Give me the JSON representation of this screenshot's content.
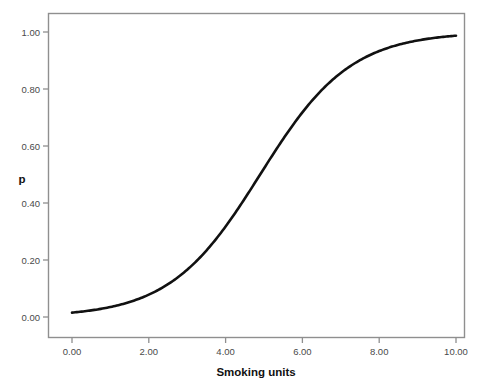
{
  "chart_data": {
    "type": "line",
    "title": "",
    "subtitle": "",
    "xlabel": "Smoking units",
    "ylabel": "p",
    "xlim": [
      0,
      10
    ],
    "ylim": [
      0.0,
      1.0
    ],
    "grid": false,
    "legend": null,
    "x_tick_labels": [
      "0.00",
      "2.00",
      "4.00",
      "6.00",
      "8.00",
      "10.00"
    ],
    "x_tick_values": [
      0,
      2,
      4,
      6,
      8,
      10
    ],
    "y_tick_labels": [
      "0.00",
      "0.20",
      "0.40",
      "0.60",
      "0.80",
      "1.00"
    ],
    "y_tick_values": [
      0.0,
      0.2,
      0.4,
      0.6,
      0.8,
      1.0
    ],
    "series": [
      {
        "name": "predicted probability",
        "curve": "logistic",
        "midpoint": 4.9,
        "slope": 0.85,
        "color": "#111111",
        "x": [
          0.0,
          0.5,
          1.0,
          1.5,
          2.0,
          2.5,
          3.0,
          3.5,
          4.0,
          4.5,
          5.0,
          5.5,
          6.0,
          6.5,
          7.0,
          7.5,
          8.0,
          8.5,
          9.0,
          9.5,
          10.0
        ],
        "values": [
          0.015,
          0.023,
          0.035,
          0.053,
          0.079,
          0.117,
          0.17,
          0.24,
          0.329,
          0.431,
          0.539,
          0.643,
          0.735,
          0.81,
          0.868,
          0.91,
          0.94,
          0.961,
          0.974,
          0.983,
          0.989
        ]
      }
    ],
    "colors": {
      "background": "#ffffff",
      "frame": "#8f8f8f",
      "curve": "#111111",
      "tick_text": "#4a4a4a",
      "axis_title": "#111111"
    }
  },
  "axes": {
    "x_title": "Smoking units",
    "y_title": "p"
  },
  "ticks": {
    "x": [
      {
        "label": "0.00"
      },
      {
        "label": "2.00"
      },
      {
        "label": "4.00"
      },
      {
        "label": "6.00"
      },
      {
        "label": "8.00"
      },
      {
        "label": "10.00"
      }
    ],
    "y": [
      {
        "label": "1.00"
      },
      {
        "label": "0.80"
      },
      {
        "label": "0.60"
      },
      {
        "label": "0.40"
      },
      {
        "label": "0.20"
      },
      {
        "label": "0.00"
      }
    ]
  }
}
